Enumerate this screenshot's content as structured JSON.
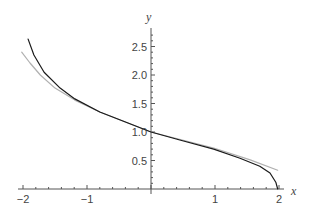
{
  "chart_data": {
    "type": "line",
    "title": "",
    "xlabel": "x",
    "ylabel": "y",
    "xlim": [
      -2.05,
      2.05
    ],
    "ylim": [
      0,
      2.7
    ],
    "grid": false,
    "legend": null,
    "x_ticks": [
      {
        "value": -2,
        "label": "−2"
      },
      {
        "value": -1,
        "label": "−1"
      },
      {
        "value": 1,
        "label": "1"
      },
      {
        "value": 2,
        "label": "2"
      }
    ],
    "y_ticks": [
      {
        "value": 0.5,
        "label": "0.5"
      },
      {
        "value": 1.0,
        "label": "1.0"
      },
      {
        "value": 1.5,
        "label": "1.5"
      },
      {
        "value": 2.0,
        "label": "2.0"
      },
      {
        "value": 2.5,
        "label": "2.5"
      }
    ],
    "series": [
      {
        "name": "function",
        "color": "#1a1a1a",
        "x": [
          -1.92,
          -1.83,
          -1.67,
          -1.42,
          -1.19,
          -0.8,
          -0.41,
          0.0,
          0.45,
          0.98,
          1.39,
          1.7,
          1.86,
          1.95,
          1.98
        ],
        "y": [
          2.63,
          2.35,
          2.05,
          1.77,
          1.58,
          1.35,
          1.18,
          1.0,
          0.86,
          0.7,
          0.54,
          0.4,
          0.28,
          0.12,
          0.0
        ]
      },
      {
        "name": "approximation",
        "color": "#b0b0b0",
        "x": [
          -2.02,
          -1.89,
          -1.73,
          -1.5,
          -1.19,
          -0.8,
          0.0,
          0.98,
          1.55,
          1.98
        ],
        "y": [
          2.4,
          2.21,
          2.0,
          1.77,
          1.56,
          1.35,
          1.0,
          0.72,
          0.51,
          0.33
        ]
      }
    ]
  },
  "axes": {
    "x_name": "x",
    "y_name": "y"
  }
}
